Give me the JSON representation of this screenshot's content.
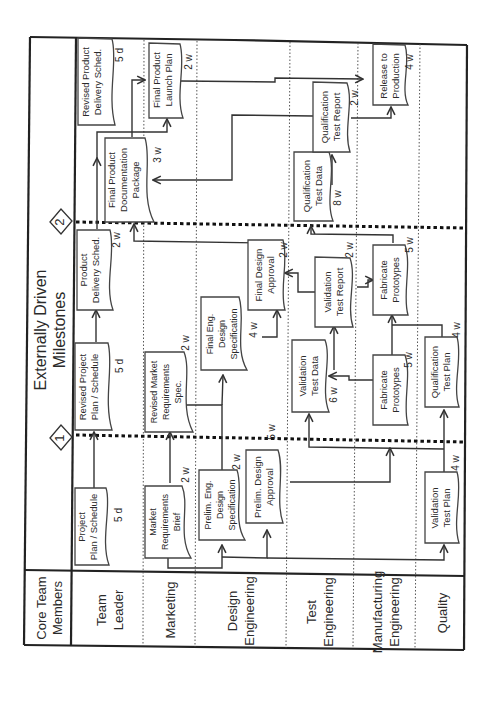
{
  "header": {
    "title_line1": "Externally Driven",
    "title_line2": "Milestones",
    "corner_line1": "Core Team",
    "corner_line2": "Members"
  },
  "milestones": [
    {
      "label": "1"
    },
    {
      "label": "2"
    }
  ],
  "lanes": [
    {
      "line1": "Team",
      "line2": "Leader"
    },
    {
      "line1": "Marketing",
      "line2": ""
    },
    {
      "line1": "Design",
      "line2": "Engineering"
    },
    {
      "line1": "Test",
      "line2": "Engineering"
    },
    {
      "line1": "Manufacturing",
      "line2": "Engineering"
    },
    {
      "line1": "Quality",
      "line2": ""
    }
  ],
  "tasks": {
    "project_plan": {
      "line1": "Project",
      "line2": "Plan / Schedule",
      "line3": "",
      "duration": "5 d"
    },
    "market_req_brief": {
      "line1": "Market",
      "line2": "Requirements",
      "line3": "Brief",
      "duration": "2 w"
    },
    "prelim_eng_design_spec": {
      "line1": "Prelim. Eng.",
      "line2": "Design",
      "line3": "Specification",
      "duration": "2 w"
    },
    "prelim_design_approval": {
      "line1": "Prelim. Design",
      "line2": "Approval",
      "line3": "",
      "duration": "5 w"
    },
    "validation_test_plan": {
      "line1": "Validation",
      "line2": "Test Plan",
      "line3": "",
      "duration": "4 w"
    },
    "revised_project_plan": {
      "line1": "Revised Project",
      "line2": "Plan / Schedule",
      "line3": "",
      "duration": "5 d"
    },
    "revised_market_req_spec": {
      "line1": "Revised Market",
      "line2": "Requirements",
      "line3": "Spec.",
      "duration": "2 w"
    },
    "final_eng_design_spec": {
      "line1": "Final Eng.",
      "line2": "Design",
      "line3": "Specification",
      "duration": "4 w"
    },
    "validation_test_data": {
      "line1": "Validation",
      "line2": "Test Data",
      "line3": "",
      "duration": "6 w"
    },
    "fabricate_prototypes_1": {
      "line1": "Fabricate",
      "line2": "Prototypes",
      "line3": "",
      "duration": "5 w"
    },
    "qualification_test_plan": {
      "line1": "Qualification",
      "line2": "Test Plan",
      "line3": "",
      "duration": "4 w"
    },
    "product_delivery_sched": {
      "line1": "Product",
      "line2": "Delivery Sched.",
      "line3": "",
      "duration": "2 w"
    },
    "final_design_approval": {
      "line1": "Final Design",
      "line2": "Approval",
      "line3": "",
      "duration": "2 w"
    },
    "validation_test_report": {
      "line1": "Validation",
      "line2": "Test Report",
      "line3": "",
      "duration": "2 w"
    },
    "fabricate_prototypes_2": {
      "line1": "Fabricate",
      "line2": "Prototypes",
      "line3": "",
      "duration": "5 w"
    },
    "revised_product_delivery_sched": {
      "line1": "Revised Product",
      "line2": "Delivery Sched.",
      "line3": "",
      "duration": "5 d"
    },
    "final_product_doc_package": {
      "line1": "Final Product",
      "line2": "Documentation",
      "line3": "Package",
      "duration": "3 w"
    },
    "final_product_launch_plan": {
      "line1": "Final Product",
      "line2": "Launch Plan",
      "line3": "",
      "duration": "2 w"
    },
    "qualification_test_data": {
      "line1": "Qualification",
      "line2": "Test Data",
      "line3": "",
      "duration": "8 w"
    },
    "qualification_test_report": {
      "line1": "Qualification",
      "line2": "Test Report",
      "line3": "",
      "duration": "2 w"
    },
    "release_to_production": {
      "line1": "Release to",
      "line2": "Production",
      "line3": "",
      "duration": "4 w"
    }
  }
}
